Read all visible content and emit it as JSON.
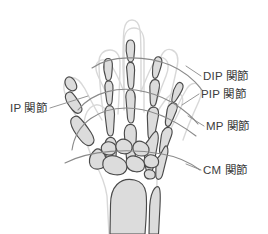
{
  "figure": {
    "background_color": "#ffffff",
    "bone_fill_color": "#dcdcdc",
    "bone_outline_color": "#4a4a4a",
    "skin_outline_color": "#d9d9d9",
    "leader_line_color": "#8a8a8a",
    "arc_line_color": "#8a8a8a",
    "label_text_color": "#3c3c3c"
  },
  "labels": {
    "dip": "DIP 関節",
    "pip": "PIP 関節",
    "mp": "MP 関節",
    "cm": "CM 関節",
    "ip": "IP 関節"
  },
  "icons": {
    "hand_skeleton": "hand-skeleton-illustration"
  }
}
